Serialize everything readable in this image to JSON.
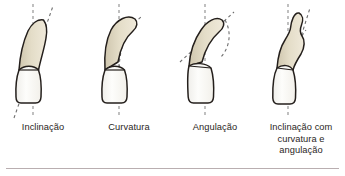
{
  "figure": {
    "background_color": "#ffffff",
    "divider_color": "#b9aeb0",
    "colors": {
      "root_fill": "#ded6bf",
      "root_fill_light": "#ece6d6",
      "crown_fill": "#fbfaf7",
      "outline": "#241f1c",
      "axis_dash": "#8c8c8c",
      "text": "#2a2624"
    },
    "panels": [
      {
        "id": "panel-inclinacao",
        "label": "Inclinação",
        "label_lines": [
          "Inclinação"
        ],
        "axes": [
          "vertical-reference-axis",
          "tilted-root-axis"
        ],
        "has_angle_arc": false
      },
      {
        "id": "panel-curvatura",
        "label": "Curvatura",
        "label_lines": [
          "Curvatura"
        ],
        "axes": [
          "vertical-reference-axis",
          "curved-root-axis"
        ],
        "has_angle_arc": false
      },
      {
        "id": "panel-angulacao",
        "label": "Angulação",
        "label_lines": [
          "Angulação"
        ],
        "axes": [
          "vertical-reference-axis",
          "angled-root-axis"
        ],
        "has_angle_arc": true
      },
      {
        "id": "panel-combinado",
        "label": "Inclinação com curvatura e angulação",
        "label_lines": [
          "Inclinação com",
          "curvatura e",
          "angulação"
        ],
        "axes": [
          "vertical-reference-axis",
          "tilted-root-axis",
          "curved-root-axis"
        ],
        "has_angle_arc": false
      }
    ]
  }
}
